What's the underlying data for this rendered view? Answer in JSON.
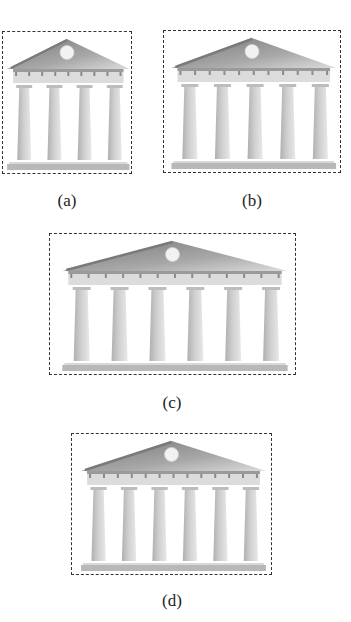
{
  "figure": {
    "panels": [
      {
        "id": "a",
        "label": "(a)",
        "columns": 4,
        "box": {
          "x": 2,
          "y": 31,
          "w": 130,
          "h": 143
        },
        "label_pos": {
          "x": 67,
          "y": 201
        }
      },
      {
        "id": "b",
        "label": "(b)",
        "columns": 5,
        "box": {
          "x": 163,
          "y": 30,
          "w": 178,
          "h": 143
        },
        "label_pos": {
          "x": 252,
          "y": 201
        }
      },
      {
        "id": "c",
        "label": "(c)",
        "columns": 6,
        "box": {
          "x": 49,
          "y": 233,
          "w": 247,
          "h": 142
        },
        "label_pos": {
          "x": 172,
          "y": 403
        }
      },
      {
        "id": "d",
        "label": "(d)",
        "columns": 6,
        "box": {
          "x": 71,
          "y": 433,
          "w": 201,
          "h": 142
        },
        "label_pos": {
          "x": 172,
          "y": 601
        }
      }
    ],
    "colors": {
      "border": "#333333",
      "roof_dark": "#7a7a7a",
      "roof_mid": "#a8a8a8",
      "roof_light": "#dcdcdc",
      "medallion": "#f2f2f2",
      "entablature": "#c4c4c4",
      "column": "#cfcfcf",
      "column_shade": "#b0b0b0",
      "base": "#b8b8b8",
      "label_text": "#222222"
    }
  }
}
